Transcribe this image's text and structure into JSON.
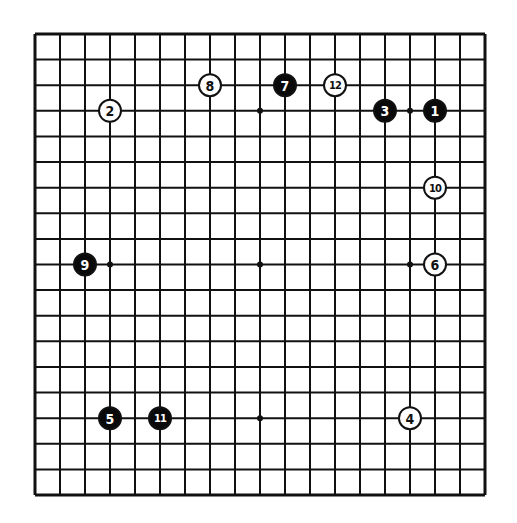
{
  "diagram": {
    "type": "go-board",
    "size": 19,
    "geometry": {
      "left": 35,
      "top": 34,
      "right": 485,
      "bottom": 495,
      "stone_radius": 11
    },
    "colors": {
      "line": "#111111",
      "black_stone": "#0a0a0a",
      "white_stone": "#ffffff",
      "black_label": "#ffffff",
      "white_label": "#111111",
      "background": "#ffffff"
    },
    "hoshi": [
      [
        3,
        3
      ],
      [
        9,
        3
      ],
      [
        15,
        3
      ],
      [
        3,
        9
      ],
      [
        9,
        9
      ],
      [
        15,
        9
      ],
      [
        3,
        15
      ],
      [
        9,
        15
      ],
      [
        15,
        15
      ]
    ],
    "stones": [
      {
        "move": "1",
        "color": "black",
        "col": 16,
        "row": 3
      },
      {
        "move": "2",
        "color": "white",
        "col": 3,
        "row": 3
      },
      {
        "move": "3",
        "color": "black",
        "col": 14,
        "row": 3
      },
      {
        "move": "4",
        "color": "white",
        "col": 15,
        "row": 15
      },
      {
        "move": "5",
        "color": "black",
        "col": 3,
        "row": 15
      },
      {
        "move": "6",
        "color": "white",
        "col": 16,
        "row": 9
      },
      {
        "move": "7",
        "color": "black",
        "col": 10,
        "row": 2
      },
      {
        "move": "8",
        "color": "white",
        "col": 7,
        "row": 2
      },
      {
        "move": "9",
        "color": "black",
        "col": 2,
        "row": 9
      },
      {
        "move": "10",
        "color": "white",
        "col": 16,
        "row": 6
      },
      {
        "move": "11",
        "color": "black",
        "col": 5,
        "row": 15
      },
      {
        "move": "12",
        "color": "white",
        "col": 12,
        "row": 2
      }
    ]
  }
}
